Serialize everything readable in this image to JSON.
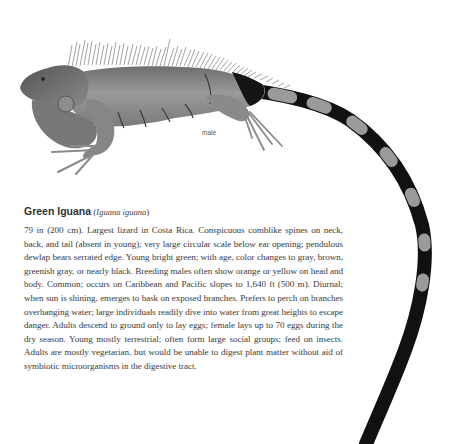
{
  "figure": {
    "caption": "male"
  },
  "entry": {
    "common_name": "Green Iguana",
    "paren_open": " (",
    "scientific_name": "Iguana iguana",
    "paren_close": ")",
    "description": "79 in (200 cm). Largest lizard in Costa Rica. Conspicuous comblike spines on neck, back, and tail (absent in young); very large circular scale below ear opening; pendulous dewlap bears serrated edge. Young bright green; with age, color changes to gray, brown, greenish gray, or nearly black. Breeding males often show orange or yellow on head and body. Common; occurs on Caribbean and Pacific slopes to 1,640 ft (500 m). Diurnal; when sun is shining, emerges to bask on exposed branches. Prefers to perch on branches overhanging water; large individuals readily dive into water from great heights to escape danger. Adults descend to ground only to lay eggs; female lays up to 70 eggs during the dry season. Young mostly terrestrial; often form large social groups; feed on insects. Adults are mostly vegetarian, but would be unable to digest plant matter without aid of symbiotic microorganisms in the digestive tract."
  },
  "colors": {
    "body": "#8f8f8f",
    "shadow": "#5a5a5a",
    "tail_dark": "#111111",
    "tail_light": "#9a9a9a"
  }
}
